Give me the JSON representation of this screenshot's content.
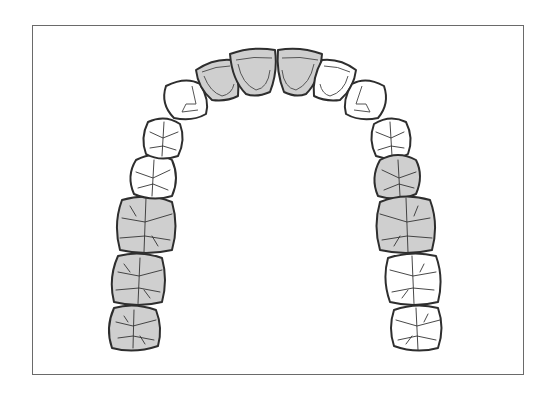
{
  "diagram": {
    "title": "",
    "view": "maxillary arch, occlusal view",
    "colors": {
      "highlight_fill": "#cfcfcf",
      "normal_fill": "#ffffff",
      "outline": "#2e2e2e",
      "frame": "#6a6a6a"
    },
    "teeth": [
      {
        "id": "left-third-molar",
        "type": "molar",
        "marked": true
      },
      {
        "id": "left-second-molar",
        "type": "molar",
        "marked": true
      },
      {
        "id": "left-first-molar",
        "type": "molar",
        "marked": true
      },
      {
        "id": "left-second-premolar",
        "type": "premolar",
        "marked": false
      },
      {
        "id": "left-first-premolar",
        "type": "premolar",
        "marked": false
      },
      {
        "id": "left-canine",
        "type": "canine",
        "marked": false
      },
      {
        "id": "left-lateral-incisor",
        "type": "incisor",
        "marked": true
      },
      {
        "id": "left-central-incisor",
        "type": "incisor",
        "marked": true
      },
      {
        "id": "right-central-incisor",
        "type": "incisor",
        "marked": true
      },
      {
        "id": "right-lateral-incisor",
        "type": "incisor",
        "marked": false
      },
      {
        "id": "right-canine",
        "type": "canine",
        "marked": false
      },
      {
        "id": "right-first-premolar",
        "type": "premolar",
        "marked": false
      },
      {
        "id": "right-second-premolar",
        "type": "premolar",
        "marked": true
      },
      {
        "id": "right-first-molar",
        "type": "molar",
        "marked": true
      },
      {
        "id": "right-second-molar",
        "type": "molar",
        "marked": false
      },
      {
        "id": "right-third-molar",
        "type": "molar",
        "marked": false
      }
    ]
  }
}
